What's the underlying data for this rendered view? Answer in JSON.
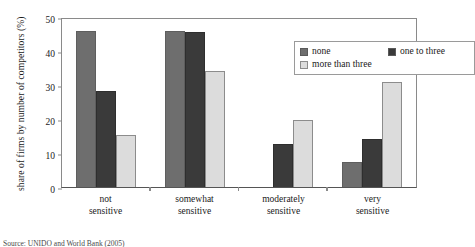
{
  "chart_data": {
    "type": "bar",
    "title": "",
    "xlabel": "",
    "ylabel": "share of firms by number of competitors (%)",
    "ylim": [
      0,
      50
    ],
    "yticks": [
      0,
      10,
      20,
      30,
      40,
      50
    ],
    "grid": false,
    "legend_position": "top-right",
    "categories": [
      "not sensitive",
      "somewhat sensitive",
      "moderately sensitive",
      "very sensitive"
    ],
    "category_lines": [
      [
        "not",
        "sensitive"
      ],
      [
        "somewhat",
        "sensitive"
      ],
      [
        "moderately",
        "sensitive"
      ],
      [
        "very",
        "sensitive"
      ]
    ],
    "series": [
      {
        "name": "none",
        "color": "#6e6e6e",
        "values": [
          46.0,
          46.0,
          0.0,
          7.5
        ]
      },
      {
        "name": "one to three",
        "color": "#3a3a3a",
        "values": [
          28.2,
          45.5,
          12.6,
          14.0
        ]
      },
      {
        "name": "more than three",
        "color": "#dcdcdc",
        "values": [
          15.4,
          34.0,
          19.7,
          31.0
        ]
      }
    ]
  },
  "legend": {
    "entries": [
      {
        "label": "none"
      },
      {
        "label": "one to three"
      },
      {
        "label": "more than three"
      }
    ]
  },
  "caption": "Source: UNIDO and World Bank (2005)"
}
